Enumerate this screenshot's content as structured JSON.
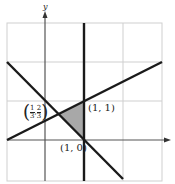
{
  "diagram": {
    "axes": {
      "x_label": "",
      "y_label": "y"
    },
    "grid": {
      "xmin": -1,
      "xmax": 3,
      "ymin": -1,
      "ymax": 3
    },
    "lines": [
      {
        "name": "x = 1"
      },
      {
        "name": "y = (x + 1)/2"
      },
      {
        "name": "y = 1 - x"
      }
    ],
    "shaded_region": {
      "vertices": [
        "(1/3, 2/3)",
        "(1, 1)",
        "(1, 0)"
      ]
    },
    "labels": {
      "point_a": "(1, 1)",
      "point_b": "(1, 0)",
      "point_c_num1": "1",
      "point_c_den1": "3",
      "point_c_num2": "2",
      "point_c_den2": "3"
    },
    "colors": {
      "shade": "#a8a8a8",
      "line": "#1a1a1a",
      "grid": "#cfcfcf"
    }
  }
}
